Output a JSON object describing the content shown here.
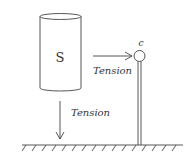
{
  "diagram": {
    "cylinder": {
      "label": "S"
    },
    "post": {
      "label": "c"
    },
    "arrows": [
      {
        "direction": "right",
        "label": "Tension"
      },
      {
        "direction": "down",
        "label": "Tension"
      }
    ],
    "ground": {
      "style": "hatched"
    },
    "colors": {
      "stroke": "#444444",
      "text": "#333333",
      "background": "#ffffff"
    }
  }
}
